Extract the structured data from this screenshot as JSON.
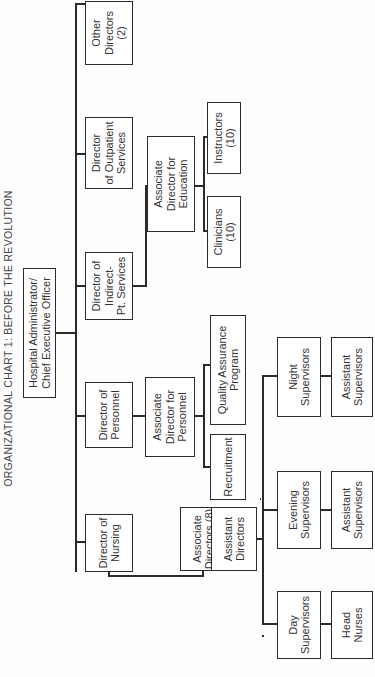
{
  "title": "ORGANIZATIONAL CHART 1:  BEFORE THE REVOLUTION",
  "root": {
    "label": "Hospital Administrator/\nChief Executive Officer"
  },
  "directors": [
    {
      "label": "Director of\nNursing"
    },
    {
      "label": "Director of\nPersonnel"
    },
    {
      "label": "Director of\nIndirect-\nPt. Services"
    },
    {
      "label": "Director\nof Outpatient\nServices"
    },
    {
      "label": "Other\nDirectors\n(2)"
    }
  ],
  "nursing": {
    "associate": "Associate\nDirectors (8)",
    "assistant": "Assistant\nDirectors",
    "shifts": [
      {
        "supervisor": "Day\nSupervisors",
        "sub": "Head\nNurses"
      },
      {
        "supervisor": "Evening\nSupervisors",
        "sub": "Assistant\nSupervisors"
      },
      {
        "supervisor": "Night\nSupervisors",
        "sub": "Assistant\nSupervisors"
      }
    ]
  },
  "personnel": {
    "associate": "Associate\nDirector for\nPersonnel",
    "children": [
      "Recruitment",
      "Quality Assurance\nProgram"
    ]
  },
  "education": {
    "associate": "Associate\nDirector for\nEducation",
    "children": [
      "Clinicians\n(10)",
      "Instructors\n(10)"
    ]
  }
}
